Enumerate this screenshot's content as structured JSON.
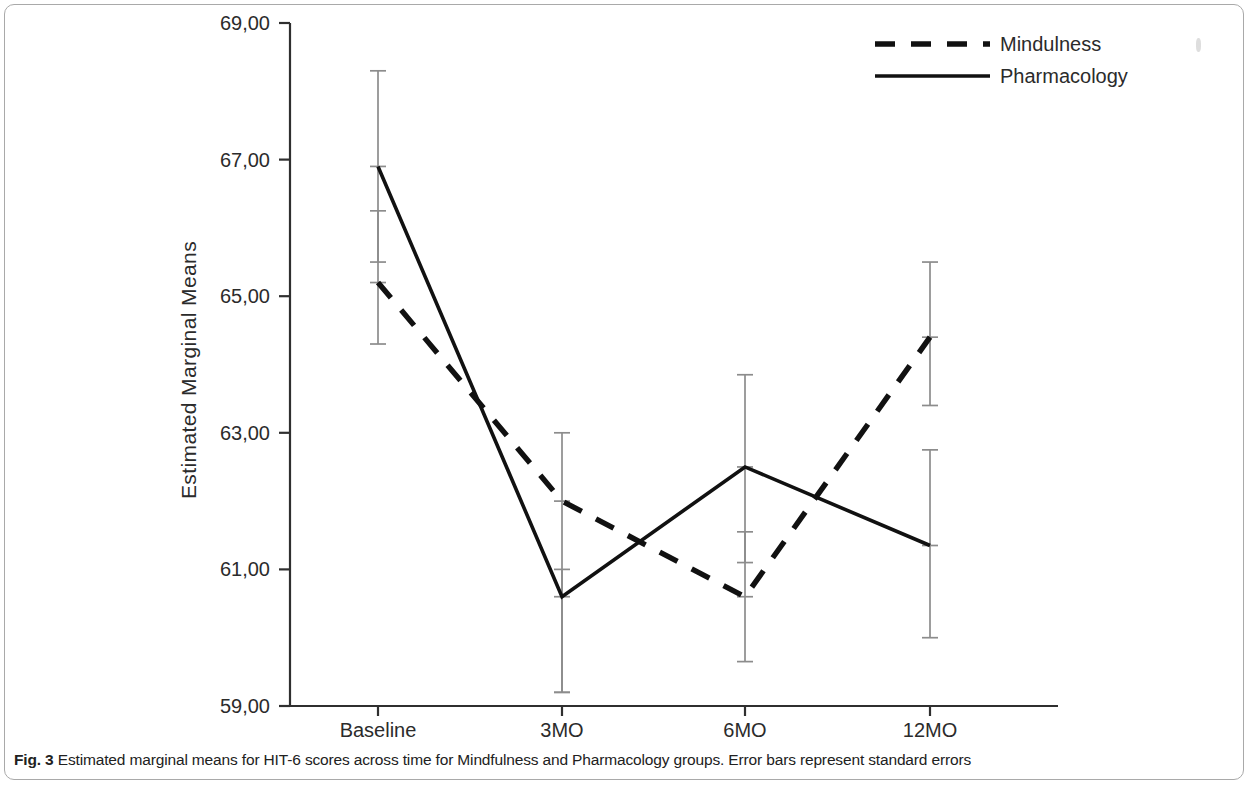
{
  "caption": {
    "label": "Fig. 3",
    "text": " Estimated marginal means for HIT-6 scores across time for Mindfulness and Pharmacology groups. Error bars represent standard errors"
  },
  "axis": {
    "y_title": "Estimated Marginal Means",
    "y_ticks": [
      "69,00",
      "67,00",
      "65,00",
      "63,00",
      "61,00",
      "59,00"
    ],
    "x_ticks": [
      "Baseline",
      "3MO",
      "6MO",
      "12MO"
    ]
  },
  "legend": {
    "items": [
      {
        "label": "Mindulness",
        "style": "dashed",
        "color": "#111111"
      },
      {
        "label": "Pharmacology",
        "style": "solid",
        "color": "#111111"
      }
    ]
  },
  "chart_data": {
    "type": "line",
    "title": "",
    "xlabel": "",
    "ylabel": "Estimated Marginal Means",
    "categories": [
      "Baseline",
      "3MO",
      "6MO",
      "12MO"
    ],
    "ylim": [
      59.0,
      69.0
    ],
    "ytick_values": [
      69.0,
      67.0,
      65.0,
      63.0,
      61.0,
      59.0
    ],
    "grid": false,
    "legend_position": "top-right",
    "error_bars": "standard errors",
    "series": [
      {
        "name": "Mindulness",
        "style": "dashed",
        "color": "#111111",
        "values": [
          65.2,
          62.0,
          60.6,
          64.4
        ],
        "err_low": [
          64.3,
          59.2,
          59.65,
          63.4
        ],
        "err_high": [
          66.25,
          63.0,
          61.55,
          65.5
        ]
      },
      {
        "name": "Pharmacology",
        "style": "solid",
        "color": "#111111",
        "values": [
          66.9,
          60.6,
          62.5,
          61.35
        ],
        "err_low": [
          65.5,
          59.2,
          61.1,
          60.0
        ],
        "err_high": [
          68.3,
          61.0,
          63.85,
          62.75
        ]
      }
    ]
  }
}
